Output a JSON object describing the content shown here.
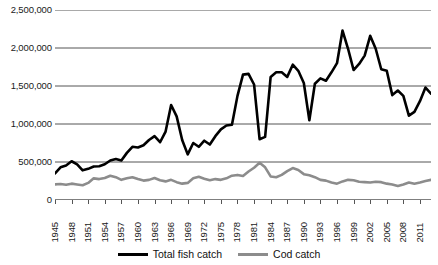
{
  "chart_data": {
    "type": "line",
    "title": "",
    "subtitle": "",
    "xlabel": "",
    "ylabel": "",
    "xlim": [
      1945,
      2013
    ],
    "ylim": [
      0,
      2500000
    ],
    "grid": true,
    "grid_axis": "y",
    "legend_position": "bottom",
    "y_ticks": [
      0,
      500000,
      1000000,
      1500000,
      2000000,
      2500000
    ],
    "y_tick_labels": [
      "0",
      "500,000",
      "1,000,000",
      "1,500,000",
      "2,000,000",
      "2,500,000"
    ],
    "x_tick_labels": [
      "1945",
      "1948",
      "1951",
      "1954",
      "1957",
      "1960",
      "1963",
      "1966",
      "1969",
      "1972",
      "1975",
      "1978",
      "1981",
      "1984",
      "1987",
      "1990",
      "1993",
      "1996",
      "1999",
      "2002",
      "2005",
      "2008",
      "2011"
    ],
    "x_tick_step": 3,
    "x": [
      1945,
      1946,
      1947,
      1948,
      1949,
      1950,
      1951,
      1952,
      1953,
      1954,
      1955,
      1956,
      1957,
      1958,
      1959,
      1960,
      1961,
      1962,
      1963,
      1964,
      1965,
      1966,
      1967,
      1968,
      1969,
      1970,
      1971,
      1972,
      1973,
      1974,
      1975,
      1976,
      1977,
      1978,
      1979,
      1980,
      1981,
      1982,
      1983,
      1984,
      1985,
      1986,
      1987,
      1988,
      1989,
      1990,
      1991,
      1992,
      1993,
      1994,
      1995,
      1996,
      1997,
      1998,
      1999,
      2000,
      2001,
      2002,
      2003,
      2004,
      2005,
      2006,
      2007,
      2008,
      2009,
      2010,
      2011,
      2012,
      2013
    ],
    "series": [
      {
        "name": "Total fish catch",
        "color": "#000000",
        "line_width": 2.6,
        "values": [
          350000,
          430000,
          455000,
          510000,
          470000,
          390000,
          410000,
          440000,
          445000,
          470000,
          520000,
          540000,
          520000,
          620000,
          700000,
          690000,
          720000,
          790000,
          840000,
          760000,
          900000,
          1250000,
          1100000,
          790000,
          600000,
          750000,
          700000,
          780000,
          730000,
          840000,
          930000,
          980000,
          990000,
          1370000,
          1650000,
          1660000,
          1520000,
          800000,
          830000,
          1620000,
          1680000,
          1680000,
          1620000,
          1780000,
          1700000,
          1540000,
          1050000,
          1530000,
          1600000,
          1570000,
          1680000,
          1800000,
          2230000,
          1990000,
          1710000,
          1790000,
          1900000,
          2160000,
          1990000,
          1720000,
          1700000,
          1380000,
          1440000,
          1370000,
          1110000,
          1160000,
          1300000,
          1480000,
          1400000
        ]
      },
      {
        "name": "Cod catch",
        "color": "#8c8c8c",
        "line_width": 2.6,
        "values": [
          205000,
          210000,
          200000,
          215000,
          205000,
          195000,
          225000,
          285000,
          275000,
          290000,
          320000,
          300000,
          265000,
          285000,
          300000,
          275000,
          255000,
          265000,
          290000,
          260000,
          245000,
          265000,
          235000,
          215000,
          225000,
          285000,
          305000,
          280000,
          260000,
          275000,
          265000,
          285000,
          320000,
          330000,
          315000,
          375000,
          425000,
          490000,
          430000,
          310000,
          300000,
          330000,
          380000,
          420000,
          395000,
          340000,
          325000,
          300000,
          265000,
          255000,
          230000,
          215000,
          245000,
          265000,
          260000,
          240000,
          235000,
          230000,
          240000,
          235000,
          215000,
          205000,
          185000,
          205000,
          230000,
          215000,
          230000,
          250000,
          265000
        ]
      }
    ]
  },
  "legend": {
    "items": [
      {
        "label": "Total fish catch",
        "color": "#000000"
      },
      {
        "label": "Cod catch",
        "color": "#8c8c8c"
      }
    ]
  }
}
